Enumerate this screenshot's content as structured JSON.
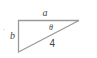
{
  "diagram": {
    "type": "right-triangle",
    "labels": {
      "top_side": "a",
      "left_side": "b",
      "hypotenuse": "4",
      "angle": "θ"
    },
    "stroke_color": "#9a9a9a",
    "text_color": "#444444",
    "dot": "·"
  }
}
